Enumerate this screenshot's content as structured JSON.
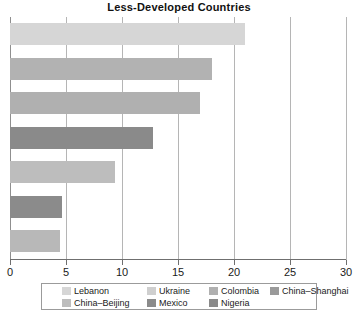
{
  "chart_data": {
    "type": "bar",
    "orientation": "horizontal",
    "title": "Less-Developed Countries",
    "xlabel": "",
    "ylabel": "",
    "xlim": [
      0,
      30
    ],
    "xticks": [
      0,
      5,
      10,
      15,
      20,
      25,
      30
    ],
    "xtick_labels": [
      "0",
      "5",
      "10",
      "15",
      "20",
      "25",
      "30"
    ],
    "grid": true,
    "grid_axis": "x",
    "legend_position": "bottom",
    "categories": [
      "Lebanon",
      "Ukraine",
      "Colombia",
      "China-Shanghai",
      "China-Beijing",
      "Mexico",
      "Nigeria"
    ],
    "values": [
      21.0,
      18.0,
      17.0,
      12.8,
      9.4,
      4.6,
      4.5
    ],
    "colors": [
      "#d6d6d6",
      "#b2b2b2",
      "#b0b0b0",
      "#8a8a8a",
      "#bdbdbd",
      "#8b8b8b",
      "#b8b8b8"
    ]
  },
  "legend": {
    "rows": [
      [
        {
          "label": "Lebanon",
          "color": "#d6d6d6",
          "left": 20
        },
        {
          "label": "Ukraine",
          "color": "#cfcfcf",
          "left": 105
        },
        {
          "label": "Colombia",
          "color": "#b0b0b0",
          "left": 167
        },
        {
          "label": "China–Shanghai",
          "color": "#9a9a9a",
          "left": 228
        }
      ],
      [
        {
          "label": "China–Beijing",
          "color": "#bdbdbd",
          "left": 20
        },
        {
          "label": "Mexico",
          "color": "#8b8b8b",
          "left": 105
        },
        {
          "label": "Nigeria",
          "color": "#8a8a8a",
          "left": 167
        }
      ]
    ]
  },
  "axis": {
    "x_min": 0,
    "x_max": 30,
    "step": 5
  },
  "style": {
    "bar_gap_color": "#ffffff",
    "gridline_color": "#b5b5b5",
    "axis_color": "#6f6f6f",
    "text_color": "#1a1a1a"
  }
}
